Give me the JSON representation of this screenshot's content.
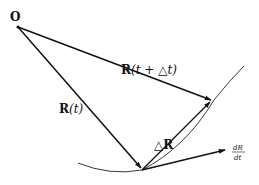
{
  "diagram": {
    "type": "vector-kinematics",
    "colors": {
      "stroke": "#111111",
      "background": "#ffffff"
    },
    "labels": {
      "origin": "O",
      "r_t": {
        "bold": "R",
        "rest": "(t)"
      },
      "r_t_dt": {
        "bold": "R",
        "rest": "(t + △t)"
      },
      "delta_r": {
        "prefix": "△",
        "bold": "R"
      },
      "derivative": {
        "numerator": "dR",
        "denominator": "dt"
      }
    },
    "points": {
      "origin": [
        18,
        27
      ],
      "tip_t": [
        142,
        170
      ],
      "tip_t_dt": [
        212,
        100
      ],
      "tangent_end": [
        226,
        150
      ]
    },
    "vectors": [
      {
        "name": "R(t)",
        "from": "origin",
        "to": "tip_t"
      },
      {
        "name": "R(t+Δt)",
        "from": "origin",
        "to": "tip_t_dt"
      },
      {
        "name": "ΔR",
        "from": "tip_t",
        "to": "tip_t_dt"
      },
      {
        "name": "dR/dt",
        "from": "tip_t",
        "to": "tangent_end"
      }
    ],
    "curve": "trajectory"
  }
}
